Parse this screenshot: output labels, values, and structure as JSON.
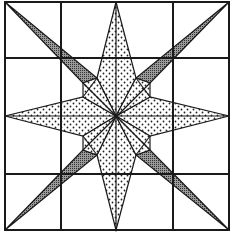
{
  "diagram": {
    "grid": {
      "rows": 4,
      "cols": 4
    },
    "colors": {
      "line": "#1a1a1a",
      "background": "#ffffff",
      "dark_fill": "#8a8a8a",
      "dotted_fill": "#ffffff"
    },
    "patterns": [
      "dotted",
      "crosshatch-dark"
    ]
  }
}
